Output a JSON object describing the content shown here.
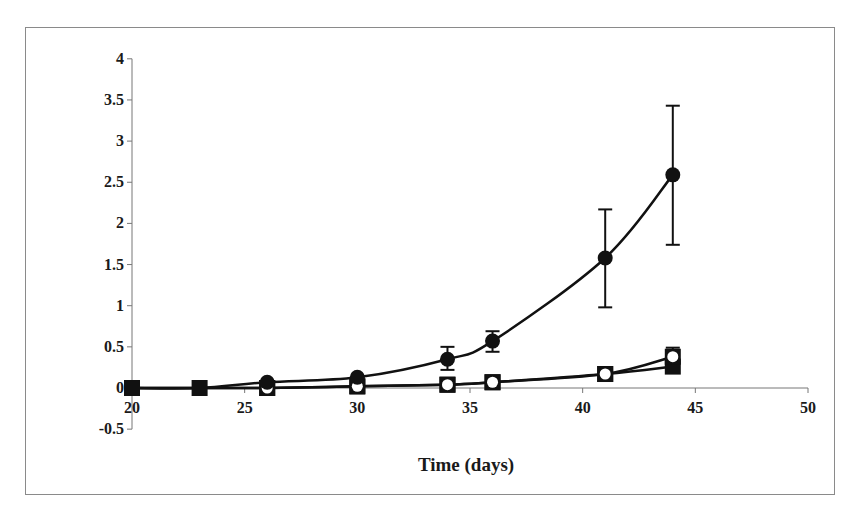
{
  "chart_data": {
    "type": "line",
    "title": "",
    "xlabel": "Time (days)",
    "ylabel": "",
    "xlim": [
      20,
      50
    ],
    "ylim": [
      -0.5,
      4
    ],
    "x_ticks": [
      20,
      25,
      30,
      35,
      40,
      45,
      50
    ],
    "y_ticks": [
      -0.5,
      0,
      0.5,
      1,
      1.5,
      2,
      2.5,
      3,
      3.5,
      4
    ],
    "y_tick_labels": [
      "-0.5",
      "0",
      "0.5",
      "1",
      "1.5",
      "2",
      "2.5",
      "3",
      "3.5",
      "4"
    ],
    "grid": false,
    "legend": null,
    "x": [
      20,
      23,
      26,
      30,
      34,
      36,
      41,
      44
    ],
    "series": [
      {
        "name": "filled-circle",
        "marker": "filled-circle",
        "values": [
          0,
          0,
          0.07,
          0.13,
          0.35,
          0.57,
          1.58,
          2.59
        ],
        "error_low": [
          0,
          0,
          0,
          0,
          0.22,
          0.44,
          0.98,
          1.74
        ],
        "error_high": [
          0,
          0,
          0,
          0,
          0.5,
          0.69,
          2.17,
          3.43
        ]
      },
      {
        "name": "open-circle",
        "marker": "open-circle",
        "values": [
          0,
          0,
          0,
          0.02,
          0.04,
          0.07,
          0.17,
          0.38
        ],
        "error_high": [
          0,
          0,
          0,
          0,
          0,
          0,
          0.22,
          0.49
        ]
      },
      {
        "name": "filled-square",
        "marker": "filled-square",
        "values": [
          0,
          0,
          0,
          0.02,
          0.04,
          0.07,
          0.17,
          0.26
        ]
      }
    ]
  },
  "axis": {
    "x_title": "Time (days)"
  }
}
